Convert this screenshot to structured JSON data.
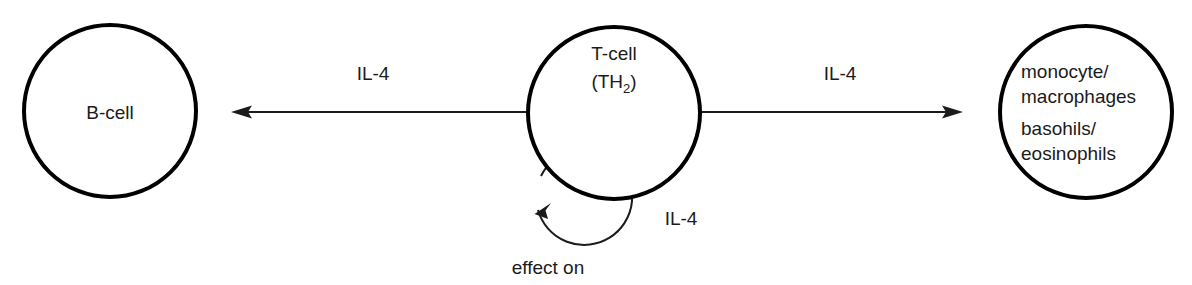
{
  "diagram": {
    "background_color": "#ffffff",
    "stroke_color": "#000000",
    "text_color": "#1b1b1b",
    "nodes": [
      {
        "id": "b-cell",
        "lines": [
          "B-cell"
        ],
        "cx": 110,
        "cy": 111,
        "r": 86
      },
      {
        "id": "t-cell",
        "lines": [
          "T-cell",
          "(TH",
          "2",
          ")"
        ],
        "label_line1": "T-cell",
        "label_line2_prefix": "(TH",
        "label_line2_subscript": "2",
        "label_line2_suffix": ")",
        "cx": 614,
        "cy": 113,
        "r": 86
      },
      {
        "id": "myeloid-cells",
        "lines": [
          "monocyte/",
          "macrophages",
          "basohils/",
          "eosinophils"
        ],
        "cx": 1086,
        "cy": 112,
        "r": 86
      }
    ],
    "edges": [
      {
        "id": "t-cell-to-b-cell",
        "label": "IL-4",
        "label_x": 373,
        "label_y": 80,
        "direction": "left"
      },
      {
        "id": "t-cell-to-myeloid",
        "label": "IL-4",
        "label_x": 840,
        "label_y": 80,
        "direction": "right"
      },
      {
        "id": "t-cell-self-loop",
        "label": "IL-4",
        "label_x": 681,
        "label_y": 225,
        "caption": "effect on",
        "caption_x": 548,
        "caption_y": 274,
        "direction": "self"
      }
    ]
  }
}
